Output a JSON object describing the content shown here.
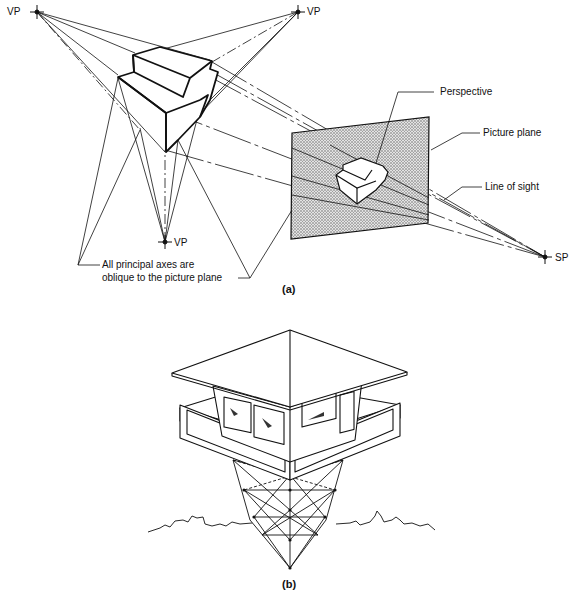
{
  "figure_a": {
    "caption": "(a)",
    "labels": {
      "vp_top_left": "VP",
      "vp_top_right": "VP",
      "vp_bottom": "VP",
      "sp": "SP",
      "perspective": "Perspective",
      "picture_plane": "Picture plane",
      "line_of_sight": "Line of sight",
      "axes_note_line1": "All principal axes are",
      "axes_note_line2": "oblique to the picture plane"
    }
  },
  "figure_b": {
    "caption": "(b)",
    "subject": "lookout-tower-three-point-perspective"
  },
  "colors": {
    "ink": "#111111",
    "plane_fill": "#c8c8c8",
    "background": "#ffffff"
  }
}
